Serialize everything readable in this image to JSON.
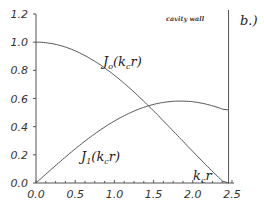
{
  "chart_data": {
    "type": "line",
    "title": "",
    "panel_label": "b.)",
    "xlabel": "k_c r",
    "ylabel": "",
    "xlim": [
      0.0,
      2.5
    ],
    "ylim": [
      0.0,
      1.2
    ],
    "x_ticks": [
      "0.0",
      "0.5",
      "1.0",
      "1.5",
      "2.0",
      "2.5"
    ],
    "y_ticks": [
      "0.0",
      "0.2",
      "0.4",
      "0.6",
      "0.8",
      "1.0",
      "1.2"
    ],
    "grid": false,
    "annotations": [
      {
        "text": "cavity wall",
        "x": 2.405
      },
      {
        "text": "J0(kc r)",
        "label_main": "J",
        "label_sub": "o",
        "label_rest": "(k",
        "label_sub2": "c",
        "label_end": "r)"
      },
      {
        "text": "J1(kc r)",
        "label_main": "J",
        "label_sub": "1",
        "label_rest": "(k",
        "label_sub2": "c",
        "label_end": "r)"
      },
      {
        "text": "kc r",
        "label_main": "k",
        "label_sub": "c",
        "label_end": "r"
      }
    ],
    "x": [
      0.0,
      0.25,
      0.5,
      0.75,
      1.0,
      1.25,
      1.5,
      1.75,
      2.0,
      2.25,
      2.405
    ],
    "series": [
      {
        "name": "J0(kc r)",
        "values": [
          1.0,
          0.984,
          0.938,
          0.864,
          0.765,
          0.646,
          0.511,
          0.369,
          0.224,
          0.083,
          0.0
        ]
      },
      {
        "name": "J1(kc r)",
        "values": [
          0.0,
          0.124,
          0.242,
          0.349,
          0.44,
          0.511,
          0.558,
          0.58,
          0.577,
          0.549,
          0.519
        ]
      }
    ]
  }
}
